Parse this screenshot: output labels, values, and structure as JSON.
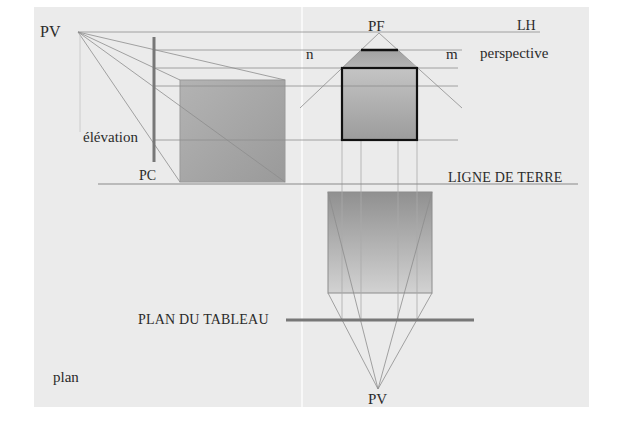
{
  "diagram": {
    "labels": {
      "pv_top": "PV",
      "lh": "LH",
      "pf": "PF",
      "n": "n",
      "m": "m",
      "perspective": "perspective",
      "elevation": "élévation",
      "pc": "PC",
      "ligne_de_terre": "LIGNE DE TERRE",
      "plan_du_tableau": "PLAN DU TABLEAU",
      "plan": "plan",
      "pv_bottom": "PV"
    },
    "colors": {
      "panel_bg": "#ebebeb",
      "construction_line": "#8a8a8a",
      "thick_line": "#7a7a7a",
      "outline": "#111111",
      "box_gray": "#a6a6a6"
    },
    "points": {
      "pv_top": [
        78,
        32
      ],
      "pf": [
        379,
        33
      ],
      "pv_bottom": [
        378,
        389
      ]
    },
    "shapes": {
      "elevation_box": {
        "x": 180,
        "y": 80,
        "w": 105,
        "h": 102
      },
      "perspective_front": {
        "x": 342,
        "y": 68,
        "w": 75,
        "h": 72
      },
      "perspective_top": {
        "top_left": 361,
        "top_right": 398,
        "top_y": 50
      },
      "plan_box": {
        "x": 328,
        "y": 192,
        "w": 104,
        "h": 101
      }
    }
  }
}
